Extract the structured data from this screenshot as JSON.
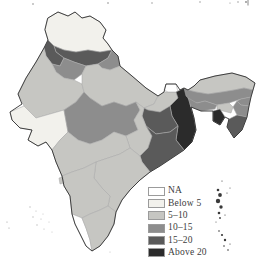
{
  "legend": {
    "items": [
      {
        "label": "NA",
        "color": "#ffffff"
      },
      {
        "label": "Below 5",
        "color": "#f2f1ec"
      },
      {
        "label": "5–10",
        "color": "#c6c6c2"
      },
      {
        "label": "10–15",
        "color": "#8d8d8d"
      },
      {
        "label": "15–20",
        "color": "#5a5a5a"
      },
      {
        "label": "Above 20",
        "color": "#2b2b2b"
      }
    ]
  },
  "map": {
    "region": "India",
    "outline_color": "#2f2f2f",
    "inner_border_color": "#a8a8a8",
    "islands": {
      "andaman_nicobar": {
        "name": "Andaman & Nicobar Islands",
        "color": "#3a3a3a"
      },
      "lakshadweep": {
        "name": "Lakshadweep",
        "color": "#b9b9b9"
      }
    },
    "states": [
      {
        "id": "jammu-kashmir",
        "name": "Jammu & Kashmir",
        "category": "Below 5"
      },
      {
        "id": "himachal-pradesh",
        "name": "Himachal Pradesh",
        "category": "15–20"
      },
      {
        "id": "punjab",
        "name": "Punjab",
        "category": "15–20"
      },
      {
        "id": "uttarakhand",
        "name": "Uttarakhand",
        "category": "10–15"
      },
      {
        "id": "haryana",
        "name": "Haryana",
        "category": "10–15"
      },
      {
        "id": "rajasthan",
        "name": "Rajasthan",
        "category": "5–10"
      },
      {
        "id": "uttar-pradesh",
        "name": "Uttar Pradesh",
        "category": "5–10"
      },
      {
        "id": "bihar",
        "name": "Bihar",
        "category": "5–10"
      },
      {
        "id": "sikkim",
        "name": "Sikkim",
        "category": "NA"
      },
      {
        "id": "west-bengal",
        "name": "West Bengal",
        "category": "Above 20"
      },
      {
        "id": "jharkhand",
        "name": "Jharkhand",
        "category": "15–20"
      },
      {
        "id": "madhya-pradesh",
        "name": "Madhya Pradesh",
        "category": "10–15"
      },
      {
        "id": "gujarat",
        "name": "Gujarat",
        "category": "Below 5"
      },
      {
        "id": "chhattisgarh",
        "name": "Chhattisgarh",
        "category": "5–10"
      },
      {
        "id": "odisha",
        "name": "Odisha",
        "category": "15–20"
      },
      {
        "id": "maharashtra",
        "name": "Maharashtra",
        "category": "5–10"
      },
      {
        "id": "goa",
        "name": "Goa",
        "category": "5–10"
      },
      {
        "id": "andhra-pradesh",
        "name": "Andhra Pradesh",
        "category": "5–10"
      },
      {
        "id": "karnataka",
        "name": "Karnataka",
        "category": "5–10"
      },
      {
        "id": "kerala",
        "name": "Kerala",
        "category": "NA"
      },
      {
        "id": "tamil-nadu",
        "name": "Tamil Nadu",
        "category": "5–10"
      },
      {
        "id": "arunachal-pradesh",
        "name": "Arunachal Pradesh",
        "category": "5–10"
      },
      {
        "id": "assam",
        "name": "Assam",
        "category": "10–15"
      },
      {
        "id": "assam-south",
        "name": "Assam (Barak Valley)",
        "category": "5–10"
      },
      {
        "id": "meghalaya",
        "name": "Meghalaya",
        "category": "10–15"
      },
      {
        "id": "nagaland",
        "name": "Nagaland",
        "category": "10–15"
      },
      {
        "id": "manipur",
        "name": "Manipur",
        "category": "10–15"
      },
      {
        "id": "mizoram",
        "name": "Mizoram",
        "category": "15–20"
      },
      {
        "id": "tripura",
        "name": "Tripura",
        "category": "Above 20"
      }
    ]
  }
}
